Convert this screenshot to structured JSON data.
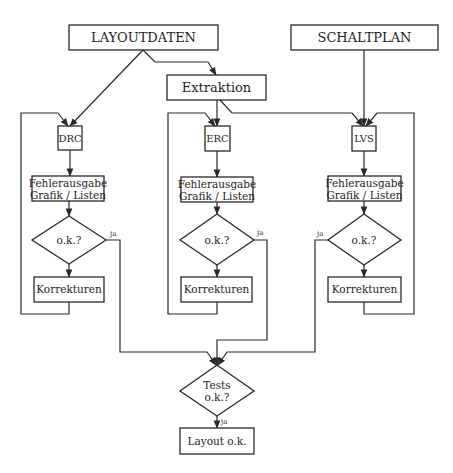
{
  "diagram": {
    "type": "flowchart",
    "sources": {
      "layout": "LAYOUTDATEN",
      "schematic": "SCHALTPLAN",
      "extraction": "Extraktion"
    },
    "columns": [
      {
        "id": "drc",
        "check": "DRC",
        "output_line1": "Fehlerausgabe",
        "output_line2": "Grafik / Listen",
        "decision": "o.k.?",
        "yes_label": "ja",
        "fix": "Korrekturen"
      },
      {
        "id": "erc",
        "check": "ERC",
        "output_line1": "Fehlerausgabe",
        "output_line2": "Grafik / Listen",
        "decision": "o.k.?",
        "yes_label": "ja",
        "fix": "Korrekturen"
      },
      {
        "id": "lvs",
        "check": "LVS",
        "output_line1": "Fehlerausgabe",
        "output_line2": "Grafik / Listen",
        "decision": "o.k.?",
        "yes_label": "ja",
        "fix": "Korrekturen"
      }
    ],
    "final": {
      "decision_line1": "Tests",
      "decision_line2": "o.k.?",
      "yes_label": "ja",
      "result": "Layout o.k."
    },
    "colors": {
      "stroke": "#2a2a2a",
      "text": "#1e1e1e",
      "background": "#ffffff"
    }
  }
}
